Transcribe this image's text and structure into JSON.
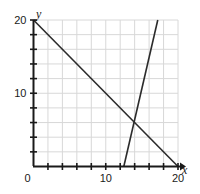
{
  "chart_data": {
    "type": "line",
    "title": "",
    "xlabel": "x",
    "ylabel": "y",
    "xlim": [
      0,
      20
    ],
    "ylim": [
      0,
      20
    ],
    "grid": true,
    "grid_step": 2,
    "tick_step": 2,
    "legend": "none",
    "xticklabels": [
      {
        "value": 0,
        "text": "0"
      },
      {
        "value": 10,
        "text": "10"
      },
      {
        "value": 20,
        "text": "20"
      }
    ],
    "yticklabels": [
      {
        "value": 10,
        "text": "10"
      },
      {
        "value": 20,
        "text": "20"
      }
    ],
    "origin_label": "0",
    "series": [
      {
        "name": "descending-line",
        "points": [
          [
            0,
            20
          ],
          [
            20,
            0
          ]
        ],
        "color": "#2b2b2b"
      },
      {
        "name": "steep-ascending-line",
        "points": [
          [
            12.5,
            0
          ],
          [
            17.2,
            20
          ]
        ],
        "color": "#2b2b2b"
      }
    ],
    "intersection": [
      14.1,
      5.9
    ],
    "colors": {
      "axis": "#1a1a1a",
      "grid": "#d8d8d8",
      "line": "#2b2b2b",
      "background": "#ffffff"
    }
  }
}
